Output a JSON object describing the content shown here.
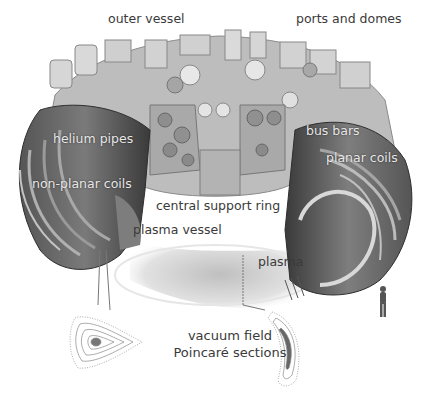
{
  "figure": {
    "colors": {
      "background": "#ffffff",
      "machine_light": "#c9c9c9",
      "machine_mid": "#8f8f8f",
      "machine_dark": "#3c3c3c",
      "plasma": "#d4d4d4",
      "label_dark": "#3a3a3a",
      "label_light": "#e8e8e8"
    },
    "labels": [
      {
        "id": "outer-vessel",
        "text": "outer vessel"
      },
      {
        "id": "ports-and-domes",
        "text": "ports and domes"
      },
      {
        "id": "helium-pipes",
        "text": "helium pipes"
      },
      {
        "id": "bus-bars",
        "text": "bus bars"
      },
      {
        "id": "planar-coils",
        "text": "planar coils"
      },
      {
        "id": "non-planar-coils",
        "text": "non-planar coils"
      },
      {
        "id": "central-support-ring",
        "text": "central support ring"
      },
      {
        "id": "plasma-vessel",
        "text": "plasma vessel"
      },
      {
        "id": "plasma",
        "text": "plasma"
      }
    ],
    "caption": {
      "line1": "vacuum field",
      "line2": "Poincaré sections"
    }
  }
}
